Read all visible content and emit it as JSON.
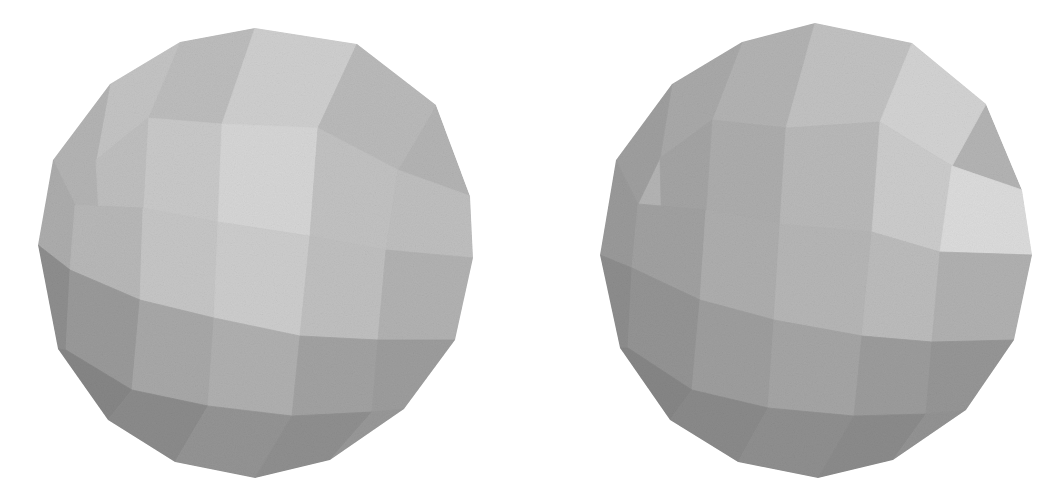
{
  "figure": {
    "background_color": "#ffffff",
    "width": 1064,
    "height": 500,
    "caption": "",
    "render_style": "flat-shaded faceted sphere, grayscale, scanned halftone grain"
  },
  "palette": {
    "background": "#ffffff",
    "highlight": "#d8d8d8",
    "light": "#cbcbcb",
    "mid_light": "#c0c0c0",
    "mid": "#b4b4b4",
    "mid_dark": "#a6a6a6",
    "dark": "#9a9a9a",
    "darker": "#8c8c8c",
    "darkest": "#7e7e7e",
    "shadow": "#757575",
    "deep_shadow": "#6d6d6d",
    "edge_line": "#a0a0a0"
  },
  "objects": [
    {
      "id": "left-polyhedron",
      "name": "left-polyhedron",
      "label": "Left view",
      "center": [
        255,
        252
      ],
      "radius_x": 218,
      "radius_y": 226,
      "apex": [
        255,
        28
      ],
      "bottom": [
        255,
        478
      ],
      "leftmost": [
        38,
        245
      ],
      "rightmost": [
        473,
        258
      ],
      "outline": [
        [
          255,
          28
        ],
        [
          357,
          44
        ],
        [
          436,
          105
        ],
        [
          470,
          196
        ],
        [
          473,
          258
        ],
        [
          455,
          340
        ],
        [
          404,
          409
        ],
        [
          330,
          460
        ],
        [
          255,
          478
        ],
        [
          175,
          462
        ],
        [
          108,
          420
        ],
        [
          58,
          349
        ],
        [
          38,
          245
        ],
        [
          53,
          160
        ],
        [
          110,
          84
        ],
        [
          180,
          42
        ]
      ],
      "facets": [
        {
          "name": "facet-top-crown-left",
          "fill": "#bdbdbd",
          "points": "255,28 180,42 148,118 222,124"
        },
        {
          "name": "facet-top-crown-mid",
          "fill": "#cfcfcf",
          "points": "255,28 222,124 318,128 357,44"
        },
        {
          "name": "facet-top-crown-right",
          "fill": "#bababa",
          "points": "357,44 318,128 398,170 436,105"
        },
        {
          "name": "facet-upper-left-a",
          "fill": "#c4c4c4",
          "points": "180,42 110,84 96,160 148,118"
        },
        {
          "name": "facet-upper-left-b",
          "fill": "#b4b4b4",
          "points": "110,84 53,160 75,205 96,160"
        },
        {
          "name": "facet-upper-ring-l1",
          "fill": "#c9c9c9",
          "points": "148,118 222,124 218,222 143,208"
        },
        {
          "name": "facet-upper-ring-l2",
          "fill": "#bfbfbf",
          "points": "96,160 148,118 143,208 100,236"
        },
        {
          "name": "facet-upper-ring-m",
          "fill": "#d6d6d6",
          "points": "222,124 318,128 310,236 218,222"
        },
        {
          "name": "facet-upper-ring-r1",
          "fill": "#c2c2c2",
          "points": "318,128 398,170 386,250 310,236"
        },
        {
          "name": "facet-upper-ring-r2",
          "fill": "#bfbfbf",
          "points": "398,170 470,196 473,258 386,250"
        },
        {
          "name": "facet-left-shoulder",
          "fill": "#adadad",
          "points": "53,160 75,205 70,270 38,245"
        },
        {
          "name": "facet-mid-left",
          "fill": "#b8b8b8",
          "points": "75,205 143,208 140,300 70,270"
        },
        {
          "name": "facet-mid-left-inner",
          "fill": "#c6c6c6",
          "points": "143,208 218,222 214,318 140,300"
        },
        {
          "name": "facet-mid-center",
          "fill": "#cdcdcd",
          "points": "218,222 310,236 300,336 214,318"
        },
        {
          "name": "facet-mid-right-inner",
          "fill": "#c0c0c0",
          "points": "310,236 386,250 378,340 300,336"
        },
        {
          "name": "facet-mid-right",
          "fill": "#b2b2b2",
          "points": "386,250 473,258 455,340 378,340"
        },
        {
          "name": "facet-lower-left-dark",
          "fill": "#8e8e8e",
          "points": "38,245 70,270 66,350 58,349"
        },
        {
          "name": "facet-lower-left-a",
          "fill": "#9a9a9a",
          "points": "70,270 140,300 132,390 66,350"
        },
        {
          "name": "facet-lower-left-b",
          "fill": "#a8a8a8",
          "points": "140,300 214,318 208,406 132,390"
        },
        {
          "name": "facet-lower-center",
          "fill": "#b0b0b0",
          "points": "214,318 300,336 292,416 208,406"
        },
        {
          "name": "facet-lower-right-a",
          "fill": "#a2a2a2",
          "points": "300,336 378,340 372,412 292,416"
        },
        {
          "name": "facet-lower-right-b",
          "fill": "#9d9d9d",
          "points": "378,340 455,340 404,409 372,412"
        },
        {
          "name": "facet-bottom-left-1",
          "fill": "#868686",
          "points": "58,349 66,350 132,390 108,420"
        },
        {
          "name": "facet-bottom-left-2",
          "fill": "#8b8b8b",
          "points": "108,420 132,390 208,406 175,462"
        },
        {
          "name": "facet-bottom-center",
          "fill": "#949494",
          "points": "175,462 208,406 292,416 255,478"
        },
        {
          "name": "facet-bottom-right-1",
          "fill": "#8f8f8f",
          "points": "255,478 292,416 372,412 330,460"
        },
        {
          "name": "facet-bottom-right-2",
          "fill": "#989898",
          "points": "330,460 372,412 404,409 404,409"
        }
      ]
    },
    {
      "id": "right-polyhedron",
      "name": "right-polyhedron",
      "label": "Right view",
      "center": [
        818,
        252
      ],
      "radius_x": 216,
      "radius_y": 228,
      "apex": [
        815,
        23
      ],
      "bottom": [
        818,
        478
      ],
      "leftmost": [
        600,
        255
      ],
      "rightmost": [
        1032,
        255
      ],
      "outline": [
        [
          815,
          23
        ],
        [
          912,
          43
        ],
        [
          986,
          104
        ],
        [
          1022,
          190
        ],
        [
          1032,
          255
        ],
        [
          1014,
          340
        ],
        [
          966,
          410
        ],
        [
          893,
          460
        ],
        [
          818,
          478
        ],
        [
          738,
          462
        ],
        [
          670,
          420
        ],
        [
          620,
          348
        ],
        [
          600,
          255
        ],
        [
          616,
          160
        ],
        [
          672,
          84
        ],
        [
          742,
          42
        ]
      ],
      "facets": [
        {
          "name": "facet-top-crown-left",
          "fill": "#b3b3b3",
          "points": "815,23 742,42 712,120 786,128"
        },
        {
          "name": "facet-top-crown-mid",
          "fill": "#c2c2c2",
          "points": "815,23 786,128 880,122 912,43"
        },
        {
          "name": "facet-top-crown-right",
          "fill": "#d3d3d3",
          "points": "912,43 880,122 952,166 986,104"
        },
        {
          "name": "facet-upper-left-a",
          "fill": "#a9a9a9",
          "points": "742,42 672,84 660,158 712,120"
        },
        {
          "name": "facet-upper-left-b",
          "fill": "#9f9f9f",
          "points": "672,84 616,160 638,204 660,158"
        },
        {
          "name": "facet-upper-ring-l1",
          "fill": "#adadad",
          "points": "712,120 786,128 780,224 706,210"
        },
        {
          "name": "facet-upper-ring-l2",
          "fill": "#a4a4a4",
          "points": "660,158 712,120 706,210 662,238"
        },
        {
          "name": "facet-upper-ring-m",
          "fill": "#b9b9b9",
          "points": "786,128 880,122 872,232 780,224"
        },
        {
          "name": "facet-upper-ring-r1",
          "fill": "#cccccc",
          "points": "880,122 952,166 940,252 872,232"
        },
        {
          "name": "facet-upper-ring-r2",
          "fill": "#dcdcdc",
          "points": "952,166 1022,190 1032,255 940,252"
        },
        {
          "name": "facet-left-shoulder",
          "fill": "#9a9a9a",
          "points": "616,160 638,204 632,268 600,255"
        },
        {
          "name": "facet-mid-left",
          "fill": "#a1a1a1",
          "points": "638,204 706,210 700,300 632,268"
        },
        {
          "name": "facet-mid-left-inner",
          "fill": "#aeaeae",
          "points": "706,210 780,224 774,320 700,300"
        },
        {
          "name": "facet-mid-center",
          "fill": "#b6b6b6",
          "points": "780,224 872,232 862,336 774,320"
        },
        {
          "name": "facet-mid-right-inner",
          "fill": "#bcbcbc",
          "points": "872,232 940,252 932,342 862,336"
        },
        {
          "name": "facet-mid-right",
          "fill": "#b1b1b1",
          "points": "940,252 1032,255 1014,340 932,342"
        },
        {
          "name": "facet-lower-left-dark",
          "fill": "#8d8d8d",
          "points": "600,255 632,268 628,348 620,348"
        },
        {
          "name": "facet-lower-left-a",
          "fill": "#949494",
          "points": "632,268 700,300 692,390 628,348"
        },
        {
          "name": "facet-lower-left-b",
          "fill": "#9e9e9e",
          "points": "700,300 774,320 768,408 692,390"
        },
        {
          "name": "facet-lower-center",
          "fill": "#a5a5a5",
          "points": "774,320 862,336 854,416 768,408"
        },
        {
          "name": "facet-lower-right-a",
          "fill": "#9c9c9c",
          "points": "862,336 932,342 926,414 854,416"
        },
        {
          "name": "facet-lower-right-b",
          "fill": "#969696",
          "points": "932,342 1014,340 966,410 926,414"
        },
        {
          "name": "facet-bottom-left-1",
          "fill": "#868686",
          "points": "620,348 628,348 692,390 670,420"
        },
        {
          "name": "facet-bottom-left-2",
          "fill": "#8a8a8a",
          "points": "670,420 692,390 768,408 738,462"
        },
        {
          "name": "facet-bottom-center",
          "fill": "#8f8f8f",
          "points": "738,462 768,408 854,416 818,478"
        },
        {
          "name": "facet-bottom-right-1",
          "fill": "#8b8b8b",
          "points": "818,478 854,416 926,414 893,460"
        },
        {
          "name": "facet-bottom-right-2",
          "fill": "#939393",
          "points": "893,460 926,414 966,410 966,410"
        }
      ]
    }
  ]
}
